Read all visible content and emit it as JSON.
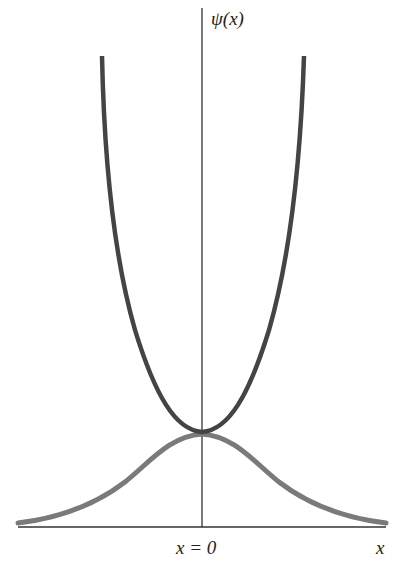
{
  "figure": {
    "y_axis_label": "ψ(x)",
    "x_axis_label": "x",
    "origin_label": "x = 0",
    "curves": [
      {
        "name": "upper-diverging-curve",
        "description": "parabola-like curve diverging upward",
        "color": "#444444"
      },
      {
        "name": "gaussian-curve",
        "description": "bell-shaped ground-state wavefunction",
        "color": "#7a7a7a"
      }
    ],
    "axis_color": "#222222"
  }
}
